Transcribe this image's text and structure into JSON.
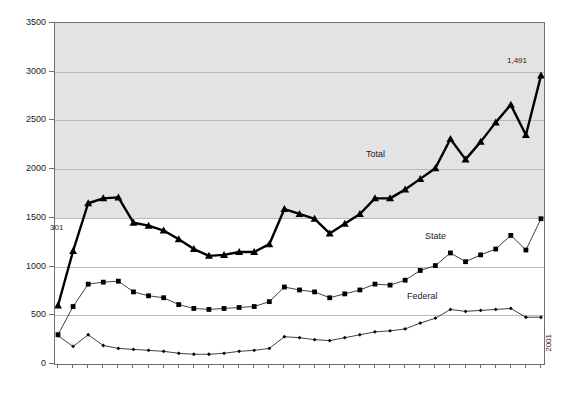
{
  "title_remnant": "",
  "axis": {
    "y_ticks": [
      0,
      500,
      1000,
      1500,
      2000,
      2500,
      3000,
      3500
    ],
    "y_min": 0,
    "y_max": 3500,
    "x_labels": [
      "1969",
      "1970",
      "1971",
      "1972",
      "1973",
      "1974",
      "1975",
      "1976",
      "1977",
      "1978",
      "1979",
      "1980",
      "1981",
      "1982",
      "1983",
      "1984",
      "1985",
      "1986",
      "1987",
      "1988",
      "1989",
      "1990",
      "1991",
      "1992",
      "1993",
      "1994",
      "1995",
      "1996",
      "1997",
      "1998",
      "1999",
      "2000",
      "2001"
    ]
  },
  "series_labels": {
    "total": "Total",
    "state": "State",
    "federal": "Federal"
  },
  "annotations": {
    "start_state": "301",
    "end_state": "1,491"
  },
  "colors": {
    "plot_band": "#e3e3e3",
    "gridline": "#b9b9b9",
    "frame": "#6f6f6f",
    "series": "#000000"
  },
  "chart_data": {
    "type": "line",
    "title": "",
    "xlabel": "",
    "ylabel": "",
    "ylim": [
      0,
      3500
    ],
    "grid": true,
    "legend_position": "inline-annotations",
    "x": [
      "1969",
      "1970",
      "1971",
      "1972",
      "1973",
      "1974",
      "1975",
      "1976",
      "1977",
      "1978",
      "1979",
      "1980",
      "1981",
      "1982",
      "1983",
      "1984",
      "1985",
      "1986",
      "1987",
      "1988",
      "1989",
      "1990",
      "1991",
      "1992",
      "1993",
      "1994",
      "1995",
      "1996",
      "1997",
      "1998",
      "1999",
      "2000",
      "2001"
    ],
    "series": [
      {
        "name": "Total",
        "marker": "triangle",
        "values": [
          600,
          1160,
          1650,
          1700,
          1710,
          1450,
          1420,
          1370,
          1280,
          1180,
          1110,
          1120,
          1150,
          1150,
          1230,
          1590,
          1540,
          1490,
          1340,
          1440,
          1540,
          1700,
          1700,
          1790,
          1900,
          2010,
          2310,
          2100,
          2280,
          2480,
          2660,
          2350,
          2960
        ]
      },
      {
        "name": "State",
        "marker": "square",
        "values": [
          301,
          590,
          820,
          840,
          850,
          740,
          700,
          680,
          610,
          570,
          560,
          570,
          580,
          590,
          640,
          790,
          760,
          740,
          680,
          720,
          760,
          820,
          810,
          860,
          960,
          1010,
          1140,
          1050,
          1120,
          1180,
          1320,
          1170,
          1491
        ]
      },
      {
        "name": "Federal",
        "marker": "diamond",
        "values": [
          290,
          180,
          300,
          190,
          160,
          150,
          140,
          130,
          110,
          100,
          100,
          110,
          130,
          140,
          160,
          280,
          270,
          250,
          240,
          270,
          300,
          330,
          340,
          360,
          420,
          470,
          560,
          540,
          550,
          560,
          570,
          480,
          480
        ]
      }
    ]
  }
}
